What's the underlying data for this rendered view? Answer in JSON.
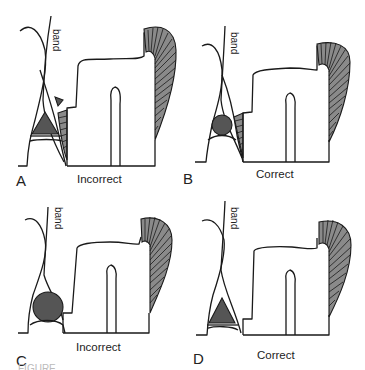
{
  "figure": {
    "panels": [
      {
        "id": "A",
        "letter": "A",
        "verdict": "Incorrect",
        "band_label": "band",
        "wedge_shape": "triangle",
        "has_arrowhead": true
      },
      {
        "id": "B",
        "letter": "B",
        "verdict": "Correct",
        "band_label": "band",
        "wedge_shape": "circle",
        "has_arrowhead": false
      },
      {
        "id": "C",
        "letter": "C",
        "verdict": "Incorrect",
        "band_label": "band",
        "wedge_shape": "circle",
        "has_arrowhead": false
      },
      {
        "id": "D",
        "letter": "D",
        "verdict": "Correct",
        "band_label": "band",
        "wedge_shape": "triangle",
        "has_arrowhead": false
      }
    ],
    "caption": "FIGURE ..."
  },
  "colors": {
    "line": "#1a1a1a",
    "wedge_fill": "#555555",
    "hatch_fill": "#8a8a8a",
    "background": "#ffffff"
  }
}
